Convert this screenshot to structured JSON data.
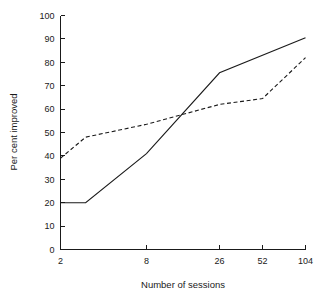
{
  "chart_data": {
    "type": "line",
    "title": "",
    "xlabel": "Number of sessions",
    "ylabel": "Per cent improved",
    "xlim": [
      2,
      104
    ],
    "ylim": [
      0,
      100
    ],
    "grid": false,
    "legend": "none",
    "x_scale": "log",
    "x_ticks": [
      2,
      8,
      26,
      52,
      104
    ],
    "x_tick_labels": [
      "2",
      "8",
      "26",
      "52",
      "104"
    ],
    "y_ticks": [
      0,
      10,
      20,
      30,
      40,
      50,
      60,
      70,
      80,
      90,
      100
    ],
    "y_tick_labels": [
      "0",
      "10",
      "20",
      "30",
      "40",
      "50",
      "60",
      "70",
      "80",
      "90",
      "100"
    ],
    "series": [
      {
        "name": "solid",
        "style": "solid",
        "color": "#1a1a1a",
        "x": [
          2,
          3,
          8,
          26,
          104
        ],
        "values": [
          20,
          20,
          41,
          75.5,
          90.5
        ]
      },
      {
        "name": "dashed",
        "style": "dashed",
        "color": "#1a1a1a",
        "x": [
          2,
          3,
          8,
          26,
          52,
          104
        ],
        "values": [
          39,
          48,
          53.5,
          62,
          64.5,
          82
        ]
      }
    ]
  },
  "axis": {
    "x_title": "Number of sessions",
    "y_title": "Per cent improved"
  }
}
